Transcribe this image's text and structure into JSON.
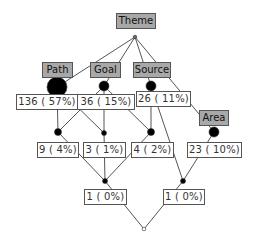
{
  "diagram": {
    "type": "concept-lattice",
    "attributes": [
      {
        "id": "theme",
        "label": "Theme"
      },
      {
        "id": "path",
        "label": "Path"
      },
      {
        "id": "goal",
        "label": "Goal"
      },
      {
        "id": "source",
        "label": "Source"
      },
      {
        "id": "area",
        "label": "Area"
      }
    ],
    "counts": [
      {
        "id": "c_path",
        "label": "136 ( 57%)"
      },
      {
        "id": "c_goal",
        "label": "36 ( 15%)"
      },
      {
        "id": "c_source",
        "label": "26 ( 11%)"
      },
      {
        "id": "c_pg",
        "label": "9 ( 4%)"
      },
      {
        "id": "c_g",
        "label": "3 ( 1%)"
      },
      {
        "id": "c_gs",
        "label": "4 ( 2%)"
      },
      {
        "id": "c_area",
        "label": "23 ( 10%)"
      },
      {
        "id": "c_pgs",
        "label": "1 ( 0%)"
      },
      {
        "id": "c_sa",
        "label": "1 ( 0%)"
      }
    ],
    "colors": {
      "attribute_fill": "#a8a8a8",
      "border": "#555555",
      "edge": "#555555",
      "node_fill": "#000000"
    }
  }
}
